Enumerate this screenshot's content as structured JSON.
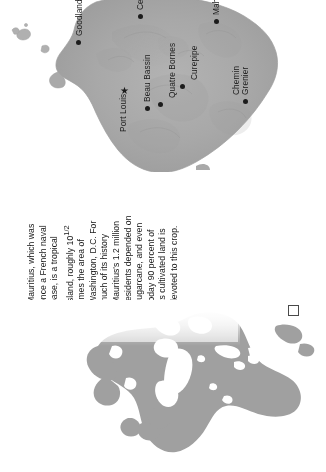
{
  "page": {
    "title": "Mauritius",
    "background_color": "#ffffff"
  },
  "detail_map": {
    "name": "mauritius-detail-map",
    "orientation": "rotated-90-clockwise",
    "land_color": "#a9a9a9",
    "shade_color": "#8f8f8f",
    "water_color": "#ffffff",
    "cities": [
      {
        "name": "Goodlands",
        "marker": "dot",
        "label_clipped": false
      },
      {
        "name": "Centre de Fla",
        "marker": "dot",
        "label_clipped": true
      },
      {
        "name": "Mahebourg",
        "marker": "dot",
        "label_clipped": false
      },
      {
        "name": "Beau Bassin",
        "marker": "dot",
        "label_clipped": false
      },
      {
        "name": "Quatre Bornes",
        "marker": "dot",
        "label_clipped": false
      },
      {
        "name": "Curepipe",
        "marker": "dot",
        "label_clipped": false
      },
      {
        "name": "Chemin Grenier",
        "marker": "dot",
        "label_clipped": false
      },
      {
        "name": "Port Louis",
        "marker": "star",
        "label_clipped": false
      }
    ]
  },
  "caption": {
    "name": "mauritius-caption",
    "line1": "Mauritius, which was",
    "line2": "once a French naval",
    "line3": "base, is a tropical",
    "line4_a": "island, roughly 10",
    "line4_frac": "1/2",
    "line5": "times the area of",
    "line6": "Washington, D.C. For",
    "line7": "much of its history",
    "line8": "Mauritius's 1.2 million",
    "line9": "residents depended on",
    "line10": "sugarcane, and even",
    "line11": "today 90 percent of",
    "line12": "its cultivated land is",
    "line13": "devoted to this crop.",
    "full_text": "Mauritius, which was once a French naval base, is a tropical island, roughly 10 1/2 times the area of Washington, D.C. For much of its history Mauritius's 1.2 million residents depended on sugarcane, and even today 90 percent of its cultivated land is devoted to this crop."
  },
  "locator_map": {
    "name": "world-locator-map",
    "orientation": "rotated-90-clockwise",
    "land_color": "#a0a0a0",
    "water_color": "#ffffff",
    "marker_box": "location-box"
  }
}
